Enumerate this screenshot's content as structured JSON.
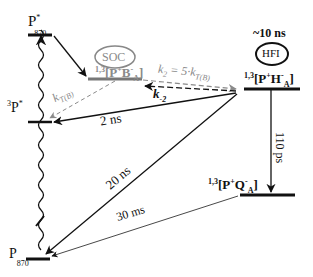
{
  "diagram": {
    "type": "kinetic-energy-level-scheme",
    "states": {
      "p870_excited": {
        "main": "P",
        "sup": "*",
        "sub": "870"
      },
      "pb_radical_pair": {
        "prefix": "1,3",
        "text": "[P",
        "sup1": "+",
        "mid": "B",
        "sup2": "-",
        "sub": "A",
        "close": "]"
      },
      "ph_radical_pair": {
        "prefix": "1,3",
        "text": "[P",
        "sup1": "+",
        "mid": "H",
        "sup2": "-",
        "sub": "A",
        "close": "]"
      },
      "triplet_p": {
        "prefix": "3",
        "main": "P",
        "sup": "*"
      },
      "pq_radical_pair": {
        "prefix": "1,3",
        "text": "[P",
        "sup1": "+",
        "mid": "Q",
        "sup2": "-",
        "sub": "A",
        "close": "]"
      },
      "p870_ground": {
        "main": "P",
        "sub": "870"
      }
    },
    "labels": {
      "soc": "SOC",
      "hfi": "HFI",
      "hfi_time": "~10 ns",
      "k2_eq_k": "k",
      "k2_eq_sub": "2",
      "k2_eq_mid": " = 5·k",
      "k2_eq_sub2": "T(B)",
      "kTB": "k",
      "kTB_sub": "T(B)",
      "k_minus2": "k",
      "k_minus2_sub": "-2",
      "t_2ns": "2 ns",
      "t_20ns": "20 ns",
      "t_110ps": "110 ps",
      "t_30ms": "30 ms"
    },
    "colors": {
      "line": "#111111",
      "gray": "#8a8a8a"
    }
  }
}
